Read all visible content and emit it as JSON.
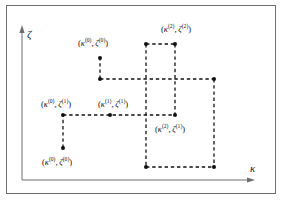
{
  "figure": {
    "title": "",
    "background": "#ffffff",
    "border_color": "#6f6f6f",
    "dash_color": "#111111",
    "dot_color": "#111111",
    "width": 283,
    "height": 203
  },
  "axes": {
    "y_label": "ζ",
    "x_label": "κ",
    "y_label_name": "zeta",
    "x_label_name": "kappa",
    "origin": [
      22,
      180
    ],
    "x_end": [
      252,
      180
    ],
    "y_end": [
      22,
      28
    ],
    "axis_color": "#6f6f6f"
  },
  "chart_data": {
    "type": "scatter",
    "title": "",
    "xlabel": "κ",
    "ylabel": "ζ",
    "grid": false,
    "legend": "none",
    "points": [
      {
        "id": "p-k0-z0",
        "label_kappa_sup": "(0)",
        "label_zeta_sup": "(0)",
        "x": 63,
        "y": 148,
        "label_pos": "below"
      },
      {
        "id": "p-k0-z1",
        "label_kappa_sup": "(0)",
        "label_zeta_sup": "(1)",
        "x": 63,
        "y": 115,
        "label_pos": "above"
      },
      {
        "id": "p-k1-z1",
        "label_kappa_sup": "(1)",
        "label_zeta_sup": "(1)",
        "x": 110,
        "y": 115,
        "label_pos": "above"
      },
      {
        "id": "p-k2-z1",
        "label_kappa_sup": "(2)",
        "label_zeta_sup": "(1)",
        "x": 175,
        "y": 115,
        "label_pos": "below"
      },
      {
        "id": "p-k1-z0",
        "label_kappa_sup": "(1)",
        "label_zeta_sup": "(0)",
        "x": 100,
        "y": 79,
        "label_pos": "none"
      },
      {
        "id": "p-k0-z0b",
        "label_kappa_sup": "(0)",
        "label_zeta_sup": "(0)",
        "x": 100,
        "y": 58,
        "label_pos": "above"
      },
      {
        "id": "p-k2-z2",
        "label_kappa_sup": "(2)",
        "label_zeta_sup": "(2)",
        "x": 175,
        "y": 44,
        "label_pos": "above"
      },
      {
        "id": "p-corner-tl",
        "label_kappa_sup": "",
        "label_zeta_sup": "",
        "x": 146,
        "y": 44,
        "label_pos": "none"
      },
      {
        "id": "p-corner-r",
        "label_kappa_sup": "",
        "label_zeta_sup": "",
        "x": 214,
        "y": 79,
        "label_pos": "none"
      },
      {
        "id": "p-corner-bl",
        "label_kappa_sup": "",
        "label_zeta_sup": "",
        "x": 146,
        "y": 167,
        "label_pos": "none"
      },
      {
        "id": "p-corner-br",
        "label_kappa_sup": "",
        "label_zeta_sup": "",
        "x": 214,
        "y": 167,
        "label_pos": "none"
      }
    ],
    "labels": [
      {
        "name": "label-k0-z0-top",
        "text": "(κ⁽⁰⁾,ζ⁽⁰⁾)",
        "kappa_sup": "(0)",
        "zeta_sup": "(0)",
        "x": 78,
        "y": 38
      },
      {
        "name": "label-k2-z2",
        "text": "(κ⁽²⁾,ζ⁽²⁾)",
        "kappa_sup": "(2)",
        "zeta_sup": "(2)",
        "x": 161,
        "y": 24
      },
      {
        "name": "label-k0-z1",
        "text": "(κ⁽⁰⁾,ζ⁽¹⁾)",
        "kappa_sup": "(0)",
        "zeta_sup": "(1)",
        "x": 41,
        "y": 99
      },
      {
        "name": "label-k1-z1",
        "text": "(κ⁽¹⁾,ζ⁽¹⁾)",
        "kappa_sup": "(1)",
        "zeta_sup": "(1)",
        "x": 98,
        "y": 99
      },
      {
        "name": "label-k2-z1",
        "text": "(κ⁽²⁾,ζ⁽¹⁾)",
        "kappa_sup": "(2)",
        "zeta_sup": "(1)",
        "x": 155,
        "y": 124
      },
      {
        "name": "label-k0-z0-bot",
        "text": "(κ⁽⁰⁾,ζ⁽⁰⁾)",
        "kappa_sup": "(0)",
        "zeta_sup": "(0)",
        "x": 42,
        "y": 157
      }
    ],
    "segments": [
      {
        "name": "seg-v-k0-lower",
        "x1": 63,
        "y1": 148,
        "x2": 63,
        "y2": 115
      },
      {
        "name": "seg-h-z1-left",
        "x1": 63,
        "y1": 115,
        "x2": 175,
        "y2": 115
      },
      {
        "name": "seg-v-k1-upper",
        "x1": 100,
        "y1": 79,
        "x2": 100,
        "y2": 58
      },
      {
        "name": "seg-h-z0-upper",
        "x1": 100,
        "y1": 79,
        "x2": 214,
        "y2": 79
      },
      {
        "name": "seg-h-top",
        "x1": 146,
        "y1": 44,
        "x2": 175,
        "y2": 44
      },
      {
        "name": "seg-v-left-box",
        "x1": 146,
        "y1": 44,
        "x2": 146,
        "y2": 167
      },
      {
        "name": "seg-v-mid-box",
        "x1": 175,
        "y1": 44,
        "x2": 175,
        "y2": 115
      },
      {
        "name": "seg-v-right-box",
        "x1": 214,
        "y1": 79,
        "x2": 214,
        "y2": 167
      },
      {
        "name": "seg-h-bottom-box",
        "x1": 146,
        "y1": 167,
        "x2": 214,
        "y2": 167
      }
    ]
  }
}
